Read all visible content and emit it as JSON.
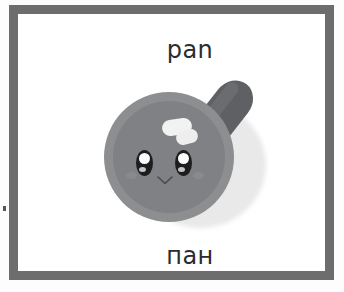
{
  "card": {
    "word_top": "pan",
    "word_bottom": "пан",
    "frame_color": "#6d6d6d",
    "background_color": "#ffffff",
    "text_color": "#2c2c2c"
  },
  "illustration": {
    "subject": "frying-pan",
    "style": "kawaii",
    "pan_rim_color": "#8d8e90",
    "pan_surface_color": "#808184",
    "handle_color": "#5f6064",
    "ferrule_color": "#bcbcbc",
    "highlight_color": "#f2f2f2",
    "eye_color": "#1d1d1f",
    "shadow_color": "#e9e9e9"
  }
}
